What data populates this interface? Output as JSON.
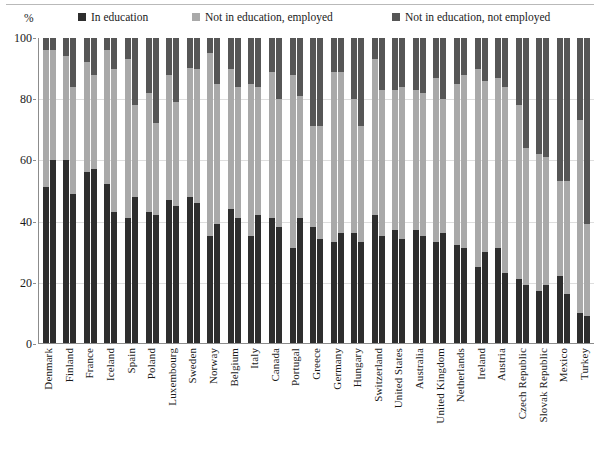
{
  "colors": {
    "in_education": "#2e2e2e",
    "not_in_education_employed": "#a9a9a9",
    "not_in_education_not_employed": "#565656",
    "axis": "#8c8c8c",
    "grid": "#dedede",
    "rule": "#b9b9b9",
    "text": "#1a1a1a"
  },
  "axis_unit_label": "%",
  "legend": [
    {
      "label": "In education",
      "color": "#2e2e2e",
      "key": "in_education"
    },
    {
      "label": "Not in education, employed",
      "color": "#a9a9a9",
      "key": "not_in_education_employed"
    },
    {
      "label": "Not in education, not employed",
      "color": "#565656",
      "key": "not_in_education_not_employed"
    }
  ],
  "y_ticks": [
    "100",
    "80",
    "60",
    "40",
    "20",
    "0"
  ],
  "chart_data": {
    "type": "bar",
    "subtype": "stacked-grouped-percentage",
    "title": "",
    "xlabel": "",
    "ylabel": "%",
    "ylim": [
      0,
      100
    ],
    "grid": true,
    "legend_position": "top",
    "stack_order": [
      "In education",
      "Not in education, employed",
      "Not in education, not employed"
    ],
    "bars_per_category": 2,
    "categories": [
      "Denmark",
      "Finland",
      "France",
      "Iceland",
      "Spain",
      "Poland",
      "Luxembourg",
      "Sweden",
      "Norway",
      "Belgium",
      "Italy",
      "Canada",
      "Portugal",
      "Greece",
      "Germany",
      "Hungary",
      "Switzerland",
      "United States",
      "Australia",
      "United Kingdom",
      "Netherlands",
      "Ireland",
      "Austria",
      "Czech Republic",
      "Slovak Republic",
      "Mexico",
      "Turkey"
    ],
    "series": [
      {
        "name": "In education",
        "color": "#2e2e2e",
        "bar_a": [
          51,
          60,
          56,
          52,
          41,
          43,
          47,
          48,
          35,
          44,
          35,
          41,
          31,
          38,
          33,
          36,
          42,
          37,
          37,
          33,
          32,
          25,
          31,
          21,
          17,
          22,
          10
        ],
        "bar_b": [
          60,
          49,
          57,
          43,
          48,
          42,
          45,
          46,
          39,
          41,
          42,
          38,
          41,
          34,
          36,
          33,
          35,
          34,
          35,
          36,
          31,
          30,
          23,
          19,
          19,
          16,
          9
        ]
      },
      {
        "name": "Not in education, employed",
        "color": "#a9a9a9",
        "bar_a": [
          45,
          34,
          36,
          44,
          52,
          39,
          41,
          42,
          60,
          46,
          50,
          48,
          57,
          33,
          56,
          44,
          51,
          46,
          46,
          54,
          53,
          65,
          56,
          57,
          45,
          31,
          63
        ],
        "bar_b": [
          36,
          35,
          31,
          47,
          30,
          30,
          34,
          44,
          46,
          43,
          42,
          42,
          40,
          37,
          53,
          38,
          48,
          50,
          47,
          44,
          57,
          56,
          61,
          45,
          42,
          37,
          30
        ]
      },
      {
        "name": "Not in education, not employed",
        "color": "#565656",
        "bar_a": [
          4,
          6,
          8,
          4,
          7,
          18,
          12,
          10,
          5,
          10,
          15,
          11,
          12,
          29,
          11,
          20,
          7,
          17,
          17,
          13,
          15,
          10,
          13,
          22,
          38,
          47,
          27
        ],
        "bar_b": [
          4,
          16,
          12,
          10,
          22,
          28,
          21,
          10,
          15,
          16,
          16,
          20,
          19,
          29,
          11,
          29,
          17,
          16,
          18,
          20,
          12,
          14,
          16,
          36,
          39,
          47,
          61
        ]
      }
    ]
  }
}
